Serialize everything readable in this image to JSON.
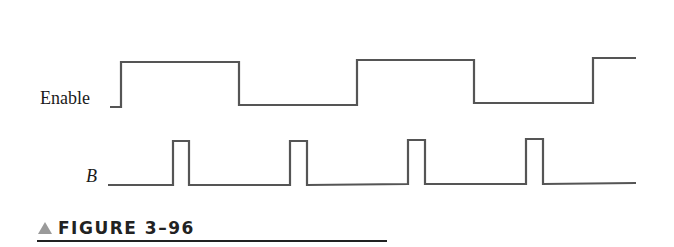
{
  "signals": [
    {
      "name": "Enable",
      "style": "roman",
      "high_y": 62,
      "low_y": 107,
      "points": "110,107 121,107 121,62 239,62 239,105 357,105 357,60 474,60 474,103 593,103 593,58 636,58"
    },
    {
      "name": "B",
      "style": "italic",
      "high_y": 141,
      "low_y": 185,
      "points": "108,185 173,185 173,141 189,141 189,185 290,185 290,141 307,141 307,185 408,184 408,140 425,140 425,184 526,184 526,139 543,139 543,184 636,183"
    }
  ],
  "waveform_color": "#555555",
  "caption": {
    "marker": "triangle",
    "text": "FIGURE 3–96"
  }
}
